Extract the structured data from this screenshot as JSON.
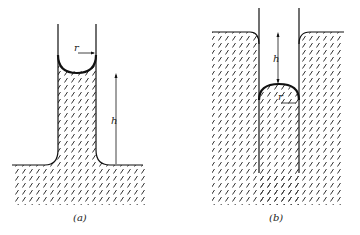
{
  "figure": {
    "panels": [
      {
        "id": "a",
        "caption": "(a)",
        "description": "Capillary rise: liquid rises in narrow tube with concave meniscus",
        "labels": {
          "radius": "r",
          "height": "h"
        }
      },
      {
        "id": "b",
        "caption": "(b)",
        "description": "Capillary depression: liquid level in tube is below the outside level with convex meniscus",
        "labels": {
          "radius": "r",
          "height": "h"
        }
      }
    ],
    "colors": {
      "line": "#111111",
      "hatch": "#333333",
      "background": "#ffffff"
    }
  }
}
